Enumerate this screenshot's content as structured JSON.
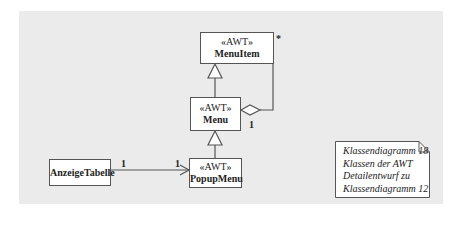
{
  "diagram": {
    "type": "UML class diagram",
    "classes": [
      {
        "id": "menuitem",
        "stereotype": "«AWT»",
        "name": "MenuItem"
      },
      {
        "id": "menu",
        "stereotype": "«AWT»",
        "name": "Menu"
      },
      {
        "id": "popupmenu",
        "stereotype": "«AWT»",
        "name": "PopupMenu"
      },
      {
        "id": "anzeigetabelle",
        "stereotype": "",
        "name": "AnzeigeTabelle"
      }
    ],
    "relations": [
      {
        "type": "generalization",
        "from": "Menu",
        "to": "MenuItem"
      },
      {
        "type": "generalization",
        "from": "PopupMenu",
        "to": "Menu"
      },
      {
        "type": "aggregation",
        "whole": "Menu",
        "part": "MenuItem",
        "whole_multiplicity": "1",
        "part_multiplicity": "*"
      },
      {
        "type": "directed-association",
        "from": "AnzeigeTabelle",
        "to": "PopupMenu",
        "from_multiplicity": "1",
        "to_multiplicity": "1"
      }
    ],
    "multiplicities": {
      "menuitem_star": "*",
      "menu_one": "1",
      "anzeige_one": "1",
      "popup_one": "1"
    },
    "note": {
      "lines": [
        "Klassendiagramm 18",
        "Klassen der AWT",
        "Detailentwurf zu",
        "Klassendiagramm 12"
      ]
    },
    "colors": {
      "background": "#ebebeb",
      "box": "#ffffff",
      "line": "#555555"
    }
  }
}
